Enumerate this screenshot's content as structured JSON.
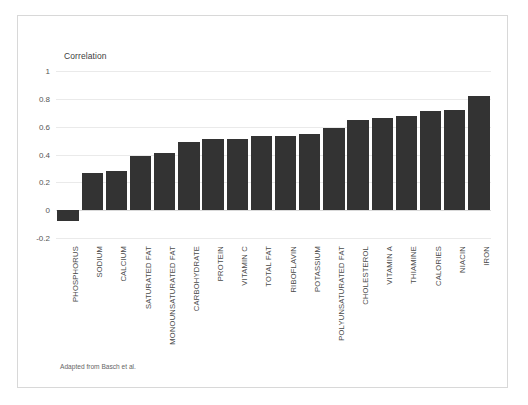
{
  "figure": {
    "caption": "Adapted from Basch et al."
  },
  "chart_data": {
    "type": "bar",
    "title": "",
    "axis_title": "Correlation",
    "xlabel": "",
    "ylabel": "Correlation",
    "ylim": [
      -0.2,
      1
    ],
    "yticks": [
      1,
      0.8,
      0.6,
      0.4,
      0.2,
      0,
      -0.2
    ],
    "ytick_labels": [
      "1",
      "0.8",
      "0.6",
      "0.4",
      "0.2",
      "0",
      "-0.2"
    ],
    "grid": true,
    "legend": null,
    "bar_color": "#333333",
    "categories": [
      "PHOSPHORUS",
      "SODIUM",
      "CALCIUM",
      "SATURATED FAT",
      "MONOUNSATURATED FAT",
      "CARBOHYDRATE",
      "PROTEIN",
      "VITAMIN C",
      "TOTAL FAT",
      "RIBOFLAVIN",
      "POTASSIUM",
      "POLYUNSATURATED FAT",
      "CHOLESTEROL",
      "VITAMIN A",
      "THIAMINE",
      "CALORIES",
      "NIACIN",
      "IRON"
    ],
    "values": [
      -0.08,
      0.27,
      0.28,
      0.39,
      0.41,
      0.49,
      0.51,
      0.51,
      0.53,
      0.53,
      0.55,
      0.59,
      0.65,
      0.66,
      0.68,
      0.71,
      0.72,
      0.82
    ]
  }
}
